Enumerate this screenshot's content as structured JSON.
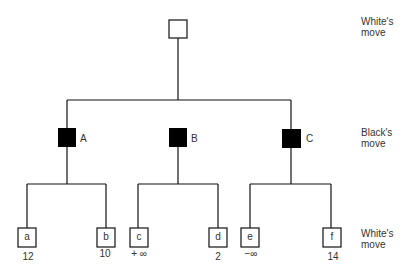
{
  "diagram": {
    "type": "game-tree",
    "levels": [
      {
        "label_line1": "White's",
        "label_line2": "move"
      },
      {
        "label_line1": "Black's",
        "label_line2": "move"
      },
      {
        "label_line1": "White's",
        "label_line2": "move"
      }
    ],
    "root": {
      "fill": "white"
    },
    "black_nodes": [
      {
        "label": "A"
      },
      {
        "label": "B"
      },
      {
        "label": "C"
      }
    ],
    "leaves": [
      {
        "label": "a",
        "value": "12"
      },
      {
        "label": "b",
        "value": "10"
      },
      {
        "label": "c",
        "value": "+ ∞"
      },
      {
        "label": "d",
        "value": "2"
      },
      {
        "label": "e",
        "value": "−∞"
      },
      {
        "label": "f",
        "value": "14"
      }
    ],
    "colors": {
      "line": "#111111",
      "black_node": "#000000",
      "white_node": "#ffffff"
    }
  }
}
